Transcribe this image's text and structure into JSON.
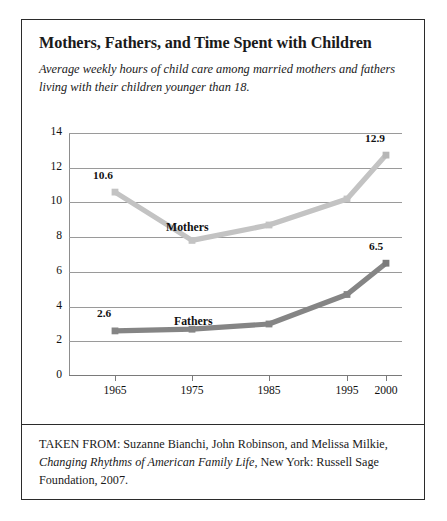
{
  "card": {
    "title": "Mothers, Fathers, and Time Spent with Children",
    "subtitle": "Average weekly hours of child care among married mothers and fathers living with their children younger than 18."
  },
  "footer": {
    "prefix": "TAKEN FROM: Suzanne Bianchi, John Robinson, and Melissa Milkie,",
    "book_title": "Changing Rhythms of American Family Life",
    "suffix": ", New York: Russell Sage Foundation, 2007."
  },
  "chart_data": {
    "type": "line",
    "title": "Mothers, Fathers, and Time Spent with Children",
    "subtitle": "Average weekly hours of child care among married mothers and fathers living with their children younger than 18.",
    "xlabel": "",
    "ylabel": "",
    "categories": [
      "1965",
      "1975",
      "1985",
      "1995",
      "2000"
    ],
    "x": [
      1965,
      1975,
      1985,
      1995,
      2000
    ],
    "ylim": [
      0,
      14
    ],
    "yticks": [
      0,
      2,
      4,
      6,
      8,
      10,
      12,
      14
    ],
    "ytick_labels": [
      "0",
      "2",
      "4",
      "6",
      "8",
      "10",
      "12",
      "14"
    ],
    "grid": true,
    "legend": "inline-series-labels",
    "series": [
      {
        "name": "Mothers",
        "color": "#c3c3c3",
        "values": [
          10.6,
          7.8,
          8.7,
          10.2,
          12.9
        ],
        "point_labels": {
          "1965": "10.6",
          "2000": "12.9"
        }
      },
      {
        "name": "Fathers",
        "color": "#858585",
        "values": [
          2.6,
          2.7,
          3.0,
          4.7,
          6.5
        ],
        "point_labels": {
          "1965": "2.6",
          "2000": "6.5"
        }
      }
    ],
    "annotations": [
      {
        "text": "10.6",
        "series": "Mothers",
        "x": "1965"
      },
      {
        "text": "12.9",
        "series": "Mothers",
        "x": "2000"
      },
      {
        "text": "2.6",
        "series": "Fathers",
        "x": "1965"
      },
      {
        "text": "6.5",
        "series": "Fathers",
        "x": "2000"
      },
      {
        "text": "Mothers",
        "series": "Mothers",
        "type": "series-label"
      },
      {
        "text": "Fathers",
        "series": "Fathers",
        "type": "series-label"
      }
    ]
  }
}
